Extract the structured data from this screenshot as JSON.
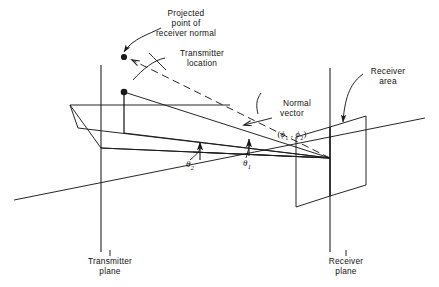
{
  "figure": {
    "type": "technical-line-diagram",
    "background_color": "#ffffff",
    "line_color": "#1a1a1a",
    "text_color": "#111111"
  },
  "labels": {
    "projected_point": "Projected\npoint of\nreceiver normal",
    "transmitter_location": "Transmitter\nlocation",
    "normal_vector_title": "Normal\nvector",
    "normal_vector_params_open": "(",
    "normal_vector_phi1": "ϕ",
    "normal_vector_sub1": "1",
    "normal_vector_comma": " , ",
    "normal_vector_phi2": "ϕ",
    "normal_vector_sub2": "2",
    "normal_vector_params_close": ")",
    "receiver_area": "Receiver\narea",
    "theta_symbol": "θ",
    "theta_2_sub": "2",
    "theta_1_sub": "1",
    "transmitter_plane": "Transmitter\nplane",
    "receiver_plane": "Receiver\nplane"
  },
  "geometry": {
    "transmitter_plane_axis": {
      "x": 101,
      "y1": 65,
      "y2": 252
    },
    "receiver_plane_axis": {
      "x": 330,
      "y1": 68,
      "y2": 252
    },
    "transmitter_location_point": {
      "x": 124,
      "y": 92
    },
    "projected_normal_point": {
      "x": 124,
      "y": 57
    },
    "receiver_convergence_point": {
      "x": 330,
      "y": 158
    },
    "ground_line_left": {
      "x": 14,
      "y": 200
    },
    "ground_line_right": {
      "x": 425,
      "y": 118
    },
    "receiver_area_quad": "(296,137) (330,127) (330,196) (296,207)",
    "receiver_area_quad_back": "(330,127) (366,116) (366,185) (330,196)"
  }
}
